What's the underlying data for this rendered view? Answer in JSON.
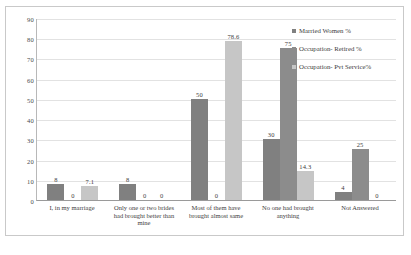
{
  "chart_data": {
    "type": "bar",
    "title": "",
    "xlabel": "",
    "ylabel": "",
    "ylim": [
      0,
      90
    ],
    "yticks": [
      0,
      10,
      20,
      30,
      40,
      50,
      60,
      70,
      80,
      90
    ],
    "grid": true,
    "legend_position": "right",
    "categories": [
      "I, in my marriage",
      "Only one or two brides had brought better than mine",
      "Most of them have brought almost same",
      "No one had brought anything",
      "Not Answered"
    ],
    "series": [
      {
        "name": "Married Women %",
        "color": "#808080",
        "values": [
          8,
          8,
          50,
          30,
          4
        ],
        "labels": [
          "8",
          "8",
          "50",
          "30",
          "4"
        ]
      },
      {
        "name": "Occupation- Retired %",
        "color": "#8c8c8c",
        "values": [
          0,
          0,
          0,
          75,
          25
        ],
        "labels": [
          "0",
          "0",
          "0",
          "75",
          "25"
        ]
      },
      {
        "name": "Occupation- Pvt Service%",
        "color": "#c6c6c6",
        "values": [
          7.1,
          0,
          78.6,
          14.3,
          0
        ],
        "labels": [
          "7.1",
          "0",
          "78.6",
          "14.3",
          "0"
        ]
      }
    ]
  }
}
